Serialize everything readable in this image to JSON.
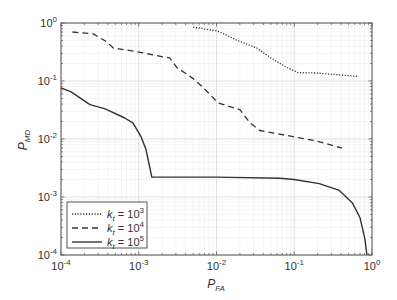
{
  "chart_data": {
    "type": "line",
    "title": "",
    "xlabel": "P_FA",
    "ylabel": "P_MD",
    "xscale": "log",
    "yscale": "log",
    "xlim": [
      0.0001,
      1
    ],
    "ylim": [
      0.0001,
      1
    ],
    "grid": "major+minor",
    "legend_position": "lower left",
    "x_ticks": [
      "10^-4",
      "10^-3",
      "10^-2",
      "10^-1",
      "10^0"
    ],
    "y_ticks": [
      "10^-4",
      "10^-3",
      "10^-2",
      "10^-1",
      "10^0"
    ],
    "series": [
      {
        "name": "k_t = 10^3",
        "style": "dotted",
        "color": "#333333",
        "x": [
          0.005,
          0.01,
          0.0125,
          0.018,
          0.033,
          0.05,
          0.075,
          0.11,
          0.2,
          0.65
        ],
        "y": [
          0.85,
          0.73,
          0.65,
          0.51,
          0.37,
          0.25,
          0.18,
          0.14,
          0.137,
          0.12
        ]
      },
      {
        "name": "k_t = 10^4",
        "style": "dashed",
        "color": "#333333",
        "x": [
          0.00014,
          0.00026,
          0.00039,
          0.00047,
          0.00095,
          0.00205,
          0.0025,
          0.0031,
          0.005,
          0.0066,
          0.0105,
          0.02,
          0.027,
          0.036,
          0.096,
          0.19,
          0.41
        ],
        "y": [
          0.7,
          0.65,
          0.47,
          0.37,
          0.32,
          0.26,
          0.25,
          0.17,
          0.11,
          0.079,
          0.042,
          0.032,
          0.019,
          0.014,
          0.011,
          0.0093,
          0.007
        ]
      },
      {
        "name": "k_t = 10^5",
        "style": "solid",
        "color": "#333333",
        "x": [
          0.0001,
          0.000135,
          0.000236,
          0.00037,
          0.00066,
          0.00084,
          0.00107,
          0.00124,
          0.00147,
          0.01,
          0.066,
          0.1,
          0.21,
          0.38,
          0.56,
          0.7,
          0.81,
          0.86
        ],
        "y": [
          0.076,
          0.065,
          0.039,
          0.033,
          0.023,
          0.019,
          0.011,
          0.0066,
          0.0022,
          0.0022,
          0.0021,
          0.002,
          0.0017,
          0.0013,
          0.00079,
          0.00044,
          0.00019,
          0.0001
        ]
      }
    ]
  },
  "axes": {
    "xlabel_main": "P",
    "xlabel_sub": "FA",
    "ylabel_main": "P",
    "ylabel_sub": "MD",
    "tick_base": "10",
    "tick_exponents": [
      "-4",
      "-3",
      "-2",
      "-1",
      "0"
    ]
  },
  "legend": {
    "entries": [
      {
        "prefix": "k",
        "sub": "t",
        "eq": " = 10",
        "exp": "3",
        "style": "dotted"
      },
      {
        "prefix": "k",
        "sub": "t",
        "eq": " = 10",
        "exp": "4",
        "style": "dashed"
      },
      {
        "prefix": "k",
        "sub": "t",
        "eq": " = 10",
        "exp": "5",
        "style": "solid"
      }
    ]
  }
}
